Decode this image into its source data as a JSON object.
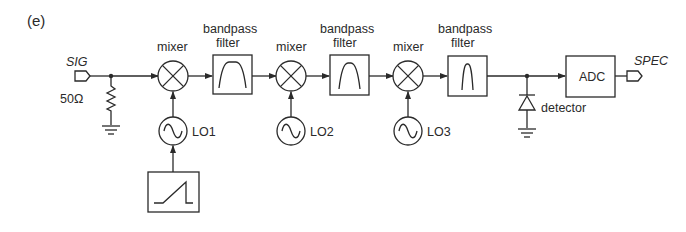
{
  "figure": {
    "panel_label": "(e)"
  },
  "ports": {
    "input": "SIG",
    "output": "SPEC"
  },
  "components": {
    "resistor": "50Ω",
    "mixer_label": "mixer",
    "filter_label_line1": "bandpass",
    "filter_label_line2": "filter",
    "lo1": "LO1",
    "lo2": "LO2",
    "lo3": "LO3",
    "detector": "detector",
    "adc": "ADC"
  },
  "icons": {
    "mixer": "circle-x-icon",
    "oscillator": "circle-sine-icon",
    "ramp": "sawtooth-ramp-icon",
    "ground": "ground-icon",
    "diode": "diode-icon",
    "port": "pentagon-port-icon"
  },
  "colors": {
    "line": "#2a2a2a",
    "background": "#ffffff"
  }
}
